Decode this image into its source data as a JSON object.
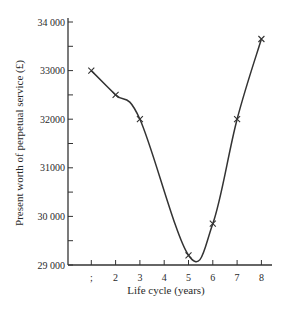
{
  "chart_data": {
    "type": "line",
    "title": "",
    "xlabel": "Life cycle (years)",
    "ylabel": "Present worth of perpetual service (£)",
    "x": [
      1,
      2,
      3,
      5,
      6,
      7,
      8
    ],
    "x_tick_labels": [
      ";",
      "2",
      "3",
      "4",
      "5",
      "6",
      "7",
      "8"
    ],
    "x_ticks": [
      1,
      2,
      3,
      4,
      5,
      6,
      7,
      8
    ],
    "y_ticks": [
      29000,
      29500,
      30000,
      30500,
      31000,
      31500,
      32000,
      32500,
      33000,
      33500,
      34000
    ],
    "y_tick_labels": [
      "29 000",
      "30 000",
      "31000",
      "32000",
      "33000",
      "34 000"
    ],
    "y_labeled_ticks": [
      29000,
      30000,
      31000,
      32000,
      33000,
      34000
    ],
    "ylim": [
      29000,
      34000
    ],
    "xlim": [
      0,
      8.5
    ],
    "grid": false,
    "legend": null,
    "series": [
      {
        "name": "Present worth",
        "marker": "x",
        "smooth": true,
        "values": [
          33000,
          32500,
          32000,
          29200,
          29850,
          32000,
          33650
        ]
      }
    ],
    "colors": {
      "line": "#333333",
      "axis": "#333333",
      "background": "#ffffff"
    }
  }
}
